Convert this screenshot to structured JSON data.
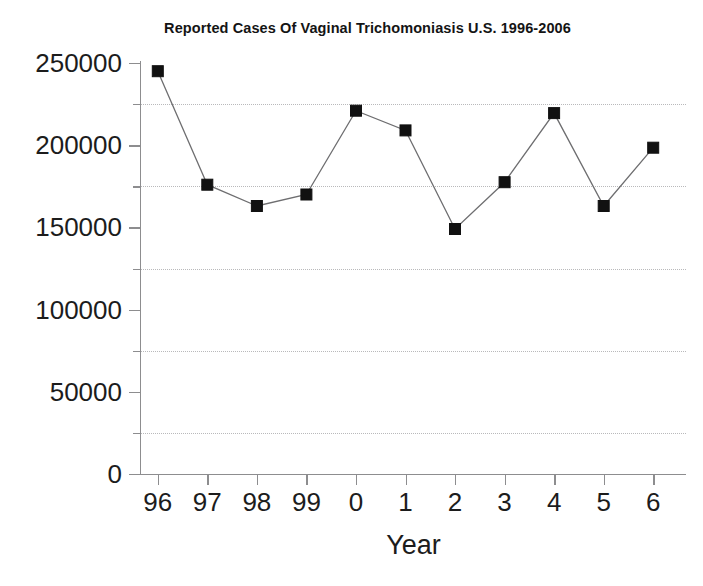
{
  "chart_data": {
    "type": "line",
    "title": "Reported Cases Of Vaginal Trichomoniasis U.S. 1996-2006",
    "xlabel": "Year",
    "ylabel": "",
    "categories": [
      "96",
      "97",
      "98",
      "99",
      "0",
      "1",
      "2",
      "3",
      "4",
      "5",
      "6"
    ],
    "full_years": [
      1996,
      1997,
      1998,
      1999,
      2000,
      2001,
      2002,
      2003,
      2004,
      2005,
      2006
    ],
    "values": [
      245000,
      176000,
      163000,
      170000,
      221000,
      209000,
      149000,
      177500,
      219500,
      163000,
      198500
    ],
    "series": [
      {
        "name": "Reported Cases",
        "values": [
          245000,
          176000,
          163000,
          170000,
          221000,
          209000,
          149000,
          177500,
          219500,
          163000,
          198500
        ]
      }
    ],
    "ylim": [
      0,
      250000
    ],
    "y_ticks": [
      0,
      50000,
      100000,
      150000,
      200000,
      250000
    ],
    "y_tick_labels": [
      "0",
      "50000",
      "100000",
      "150000",
      "200000",
      "250000"
    ],
    "y_minor_ticks": [
      25000,
      75000,
      125000,
      175000,
      225000
    ],
    "gridlines": [
      25000,
      75000,
      125000,
      175000,
      225000
    ],
    "grid": true,
    "grid_style": "dotted",
    "grid_color": "#b9b9bb",
    "legend": null,
    "legend_position": "none",
    "marker_style": "square",
    "marker_color": "#111111",
    "line_color": "#6e6e70",
    "background_color": "#ffffff",
    "axis_color": "#8d8d8f"
  },
  "axis": {
    "y_labels": [
      "250000",
      "200000",
      "150000",
      "100000",
      "50000",
      "0"
    ],
    "x_labels": [
      "96",
      "97",
      "98",
      "99",
      "0",
      "1",
      "2",
      "3",
      "4",
      "5",
      "6"
    ],
    "x_title": "Year"
  }
}
